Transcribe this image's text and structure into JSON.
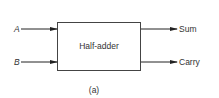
{
  "diagram": {
    "block_label": "Half-adder",
    "inputs": [
      "A",
      "B"
    ],
    "outputs": [
      "Sum",
      "Carry"
    ],
    "caption": "(a)"
  }
}
